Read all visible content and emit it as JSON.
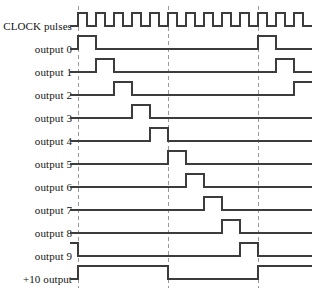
{
  "figure": {
    "type": "timing-diagram",
    "width": 314,
    "height": 292,
    "line_color": "#3c3c3c",
    "marker_color": "#9a9a9a",
    "background": "#ffffff"
  },
  "axis": {
    "wave_start_x": 78,
    "wave_end_x": 312,
    "clock_period_px": 18,
    "clock_cycles_visible": 13,
    "row_spacing_px": 23,
    "first_baseline_y": 26,
    "wave_amplitude_px": 13
  },
  "markers": {
    "style": "dashed-vertical",
    "x_positions": [
      78,
      168,
      258
    ],
    "labels": [
      "cycle 0",
      "cycle 5",
      "cycle 10"
    ]
  },
  "rows": [
    {
      "label": "CLOCK pulses",
      "name": "clock-pulses",
      "baseline_y": 26,
      "kind": "clock",
      "description": "Continuous square wave, 13 pulses, 18 px period, 50% duty"
    },
    {
      "label": "output 0",
      "name": "output-0",
      "baseline_y": 49,
      "kind": "pulse",
      "high_intervals": [
        [
          78,
          96
        ],
        [
          258,
          276
        ]
      ],
      "description": "High during clock cycle 0 and again at cycle 10"
    },
    {
      "label": "output 1",
      "name": "output-1",
      "baseline_y": 72,
      "kind": "pulse",
      "high_intervals": [
        [
          96,
          114
        ],
        [
          276,
          294
        ]
      ],
      "description": "High during clock cycle 1 and again at cycle 11"
    },
    {
      "label": "output 2",
      "name": "output-2",
      "baseline_y": 95,
      "kind": "pulse",
      "high_intervals": [
        [
          114,
          132
        ],
        [
          294,
          312
        ]
      ],
      "description": "High during clock cycle 2 and again at cycle 12"
    },
    {
      "label": "output 3",
      "name": "output-3",
      "baseline_y": 118,
      "kind": "pulse",
      "high_intervals": [
        [
          132,
          150
        ]
      ],
      "description": "High during clock cycle 3"
    },
    {
      "label": "output 4",
      "name": "output-4",
      "baseline_y": 141,
      "kind": "pulse",
      "high_intervals": [
        [
          150,
          168
        ]
      ],
      "description": "High during clock cycle 4"
    },
    {
      "label": "output 5",
      "name": "output-5",
      "baseline_y": 164,
      "kind": "pulse",
      "high_intervals": [
        [
          168,
          186
        ]
      ],
      "description": "High during clock cycle 5"
    },
    {
      "label": "output 6",
      "name": "output-6",
      "baseline_y": 187,
      "kind": "pulse",
      "high_intervals": [
        [
          186,
          204
        ]
      ],
      "description": "High during clock cycle 6"
    },
    {
      "label": "output 7",
      "name": "output-7",
      "baseline_y": 210,
      "kind": "pulse",
      "high_intervals": [
        [
          204,
          222
        ]
      ],
      "description": "High during clock cycle 7"
    },
    {
      "label": "output 8",
      "name": "output-8",
      "baseline_y": 233,
      "kind": "pulse",
      "high_intervals": [
        [
          222,
          240
        ]
      ],
      "description": "High during clock cycle 8"
    },
    {
      "label": "output 9",
      "name": "output-9",
      "baseline_y": 256,
      "kind": "pulse",
      "high_intervals": [
        [
          70,
          78
        ],
        [
          240,
          258
        ]
      ],
      "description": "High at the tail of the previous count and during clock cycle 9"
    },
    {
      "label": "+10 output",
      "name": "carry-output",
      "baseline_y": 279,
      "kind": "pulse",
      "high_intervals": [
        [
          78,
          168
        ],
        [
          258,
          312
        ]
      ],
      "description": "Carry out: high for cycles 0-4, low for cycles 5-9, high again from cycle 10"
    }
  ]
}
